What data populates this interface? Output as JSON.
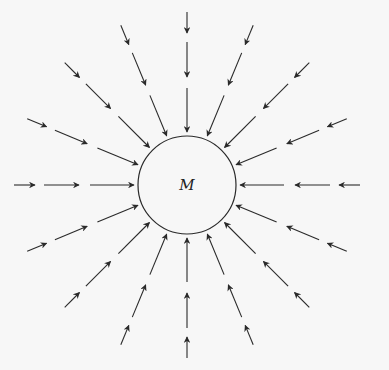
{
  "diagram": {
    "mass_label": "M",
    "center": [
      187,
      185
    ],
    "radius": 49,
    "directions": 16,
    "segments": [
      [
        53,
        97
      ],
      [
        108,
        143
      ],
      [
        152,
        173
      ]
    ],
    "line_color": "#2a2a2a",
    "background": "#f7f7f7"
  }
}
